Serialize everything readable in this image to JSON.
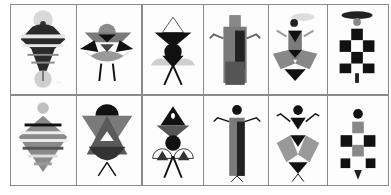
{
  "layout": {
    "rows": 2,
    "columns": 6
  },
  "colors": {
    "black": "#111111",
    "dark_grey": "#3c3c3c",
    "mid_grey": "#7a7a7a",
    "light_grey": "#a9a9a9",
    "pale_grey": "#d0d0d0",
    "paper": "#fdfdfd",
    "border": "#8a8a8a"
  },
  "panels": [
    {
      "id": "r1c1",
      "label": "Striped spinning-top figure with halo"
    },
    {
      "id": "r1c2",
      "label": "Geometric bird figure with legs"
    },
    {
      "id": "r1c3",
      "label": "Hourglass triangle figure with semicircles"
    },
    {
      "id": "r1c4",
      "label": "Tall robed figure with raised arms"
    },
    {
      "id": "r1c5",
      "label": "Dancer with hat and diamond skirt"
    },
    {
      "id": "r1c6",
      "label": "Checkerboard dress figure with wide hat"
    },
    {
      "id": "r2c1",
      "label": "Striped diamond figure with round head"
    },
    {
      "id": "r2c2",
      "label": "Triangle bird figure with dark dome"
    },
    {
      "id": "r2c3",
      "label": "Triangle fractal figure"
    },
    {
      "id": "r2c4",
      "label": "Column figure with round head"
    },
    {
      "id": "r2c5",
      "label": "Triangle dancer with round head"
    },
    {
      "id": "r2c6",
      "label": "Checker figure with round head"
    }
  ]
}
